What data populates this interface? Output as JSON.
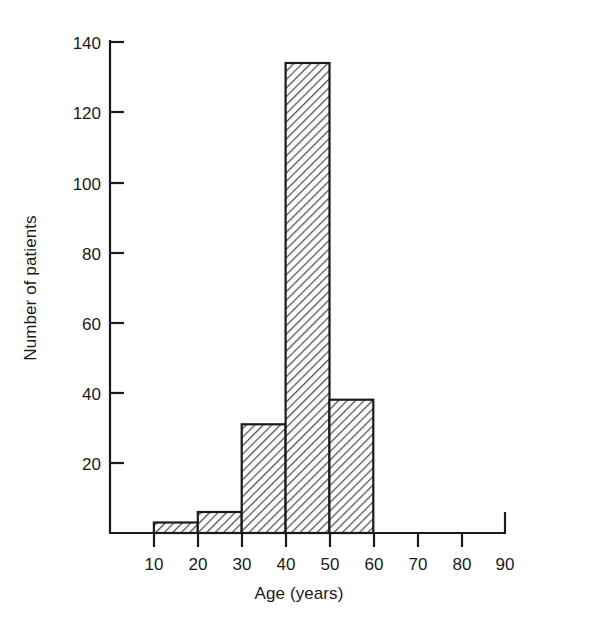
{
  "caption": {
    "text": "patients (Fig. 1). The"
  },
  "chart_data": {
    "type": "bar",
    "title": "",
    "subtitle": "",
    "xlabel": "Age (years)",
    "ylabel": "Number of patients",
    "grid": false,
    "legend": "none",
    "bin_width": 10,
    "xlim": [
      0,
      90
    ],
    "ylim": [
      0,
      140
    ],
    "xticks": [
      10,
      20,
      30,
      40,
      50,
      60,
      70,
      80,
      90
    ],
    "yticks": [
      0,
      20,
      40,
      60,
      80,
      100,
      120,
      140
    ],
    "xtick_labels": [
      "10",
      "20",
      "30",
      "40",
      "50",
      "60",
      "70",
      "80",
      "90"
    ],
    "ytick_labels": [
      "",
      "20",
      "40",
      "60",
      "80",
      "100",
      "120",
      "140"
    ],
    "categories": [
      "10-20",
      "20-30",
      "30-40",
      "40-50",
      "50-60"
    ],
    "bins": [
      {
        "label": "10-20",
        "x0": 10,
        "x1": 20,
        "value": 3
      },
      {
        "label": "20-30",
        "x0": 20,
        "x1": 30,
        "value": 6
      },
      {
        "label": "30-40",
        "x0": 30,
        "x1": 40,
        "value": 31
      },
      {
        "label": "40-50",
        "x0": 40,
        "x1": 50,
        "value": 134
      },
      {
        "label": "50-60",
        "x0": 50,
        "x1": 60,
        "value": 38
      }
    ],
    "values": [
      3,
      6,
      31,
      134,
      38
    ],
    "style": {
      "bar_fill": "hatch-diagonal",
      "bar_edge_color": "#1a1a1a",
      "hatch_color": "#4a4a4a",
      "axis_color": "#1a1a1a",
      "background": "#ffffff"
    }
  }
}
